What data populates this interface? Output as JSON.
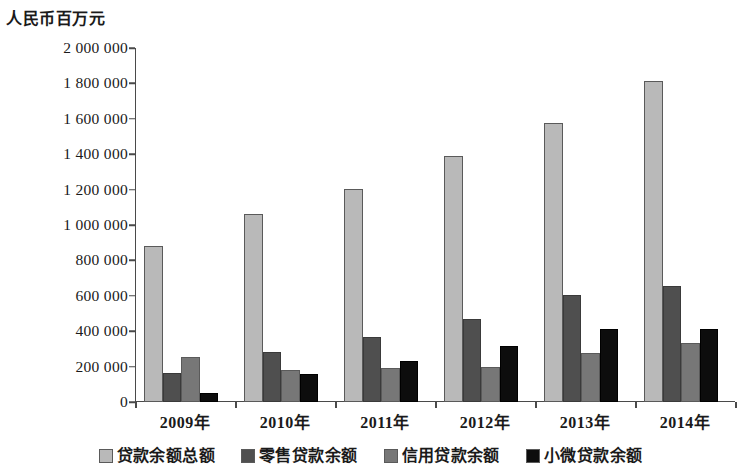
{
  "chart_data": {
    "type": "bar",
    "title": "",
    "subtitle": "",
    "xlabel": "",
    "ylabel": "人民币百万元",
    "ylim": [
      0,
      2000000
    ],
    "ytick_labels": [
      "2 000 000",
      "1 800 000",
      "1 600 000",
      "1 400 000",
      "1 200 000",
      "1 000 000",
      "800 000",
      "600 000",
      "400 000",
      "200 000",
      "0"
    ],
    "ytick_values": [
      2000000,
      1800000,
      1600000,
      1400000,
      1200000,
      1000000,
      800000,
      600000,
      400000,
      200000,
      0
    ],
    "grid": false,
    "legend_position": "bottom",
    "categories": [
      "2009年",
      "2010年",
      "2011年",
      "2012年",
      "2013年",
      "2014年"
    ],
    "series": [
      {
        "name": "贷款余额总额",
        "color": "#b9b9b9",
        "values": [
          880000,
          1060000,
          1205000,
          1390000,
          1575000,
          1815000
        ]
      },
      {
        "name": "零售贷款余额",
        "color": "#4f4f4f",
        "values": [
          165000,
          280000,
          370000,
          468000,
          605000,
          655000
        ]
      },
      {
        "name": "信用贷款余额",
        "color": "#777777",
        "values": [
          255000,
          178000,
          190000,
          200000,
          275000,
          335000
        ]
      },
      {
        "name": "小微贷款余额",
        "color": "#0d0d0d",
        "values": [
          50000,
          160000,
          232000,
          318000,
          412000,
          415000
        ]
      }
    ]
  }
}
